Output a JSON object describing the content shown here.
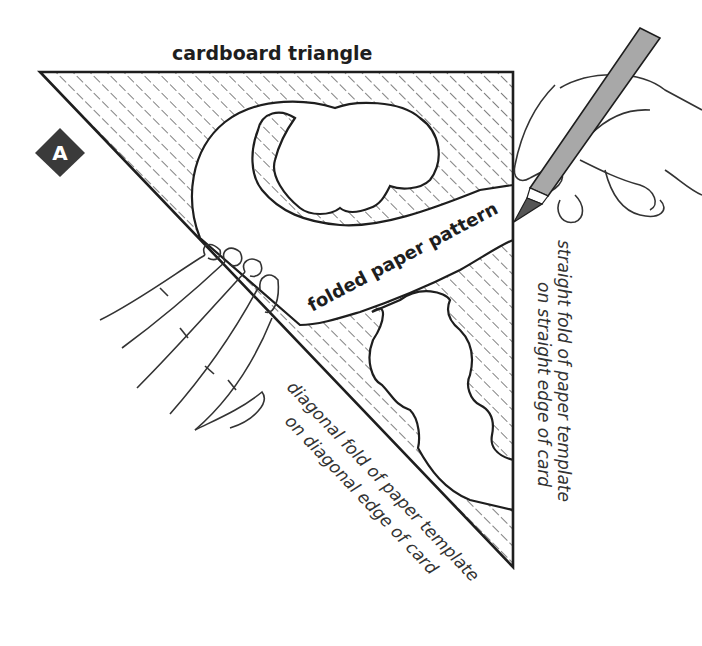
{
  "figure": {
    "step_badge": "A",
    "title": "cardboard triangle",
    "pattern_label": "folded paper pattern",
    "straight_caption": {
      "line1": "straight fold of paper template",
      "line2": "on straight edge of card"
    },
    "diagonal_caption": {
      "line1": "diagonal fold of paper template",
      "line2": "on diagonal edge of card"
    }
  },
  "colors": {
    "ink": "#1e1e1e",
    "badge": "#3a3a3a",
    "pencil": "#a8a8a8",
    "pencil_tip": "#555555"
  }
}
